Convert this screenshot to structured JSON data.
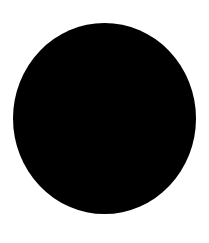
{
  "image": {
    "kind": "raster-photo-shape",
    "width": 209,
    "height": 243,
    "background_color": "#ffffff",
    "has_text": false,
    "has_ui_chrome": false,
    "description": "A single solid black filled circle centered on a plain white background."
  },
  "shapes": [
    {
      "name": "black-circle",
      "type": "circle",
      "fill_color": "#000000",
      "stroke": "none",
      "left": 13,
      "top": 23,
      "width": 183,
      "height": 191,
      "center_x": 104.5,
      "center_y": 118.5,
      "edge": "soft-antialiased"
    }
  ]
}
